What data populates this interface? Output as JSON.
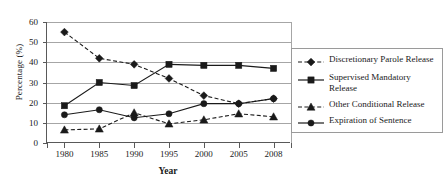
{
  "chart_data": {
    "type": "line",
    "title": "",
    "xlabel": "Year",
    "ylabel": "Percentage (%)",
    "categories": [
      "1980",
      "1985",
      "1990",
      "1995",
      "2000",
      "2005",
      "2008"
    ],
    "ylim": [
      0,
      60
    ],
    "ytick_labels": [
      "0",
      "10",
      "20",
      "30",
      "40",
      "50",
      "60"
    ],
    "ytick_values": [
      0,
      10,
      20,
      30,
      40,
      50,
      60
    ],
    "grid": "horizontal",
    "legend_position": "right",
    "series": [
      {
        "name": "Discretionary Parole Release",
        "marker": "diamond",
        "line_style": "dashed",
        "color": "#1a1a1a",
        "values": [
          55,
          42,
          39,
          32,
          23.5,
          19.5,
          22
        ]
      },
      {
        "name": "Supervised Mandatory Release",
        "legend_label": "Supervised Mandatory\nRelease",
        "marker": "square",
        "line_style": "solid",
        "color": "#1a1a1a",
        "values": [
          18.5,
          30,
          28.5,
          39,
          38.5,
          38.5,
          37
        ]
      },
      {
        "name": "Other Conditional Release",
        "marker": "triangle",
        "line_style": "dashed",
        "color": "#1a1a1a",
        "values": [
          6.5,
          7,
          15,
          9.5,
          11.5,
          14.5,
          13
        ]
      },
      {
        "name": "Expiration of Sentence",
        "marker": "circle",
        "line_style": "solid",
        "color": "#1a1a1a",
        "values": [
          14,
          16.5,
          12.5,
          14.5,
          19.5,
          19.5,
          22
        ]
      }
    ]
  },
  "legend": {
    "entries": [
      "Discretionary Parole Release",
      "Supervised Mandatory\nRelease",
      "Other Conditional Release",
      "Expiration of Sentence"
    ]
  },
  "colors": {
    "line": "#1a1a1a",
    "grid": "#a6a6a6",
    "axis": "#595959",
    "background": "#ffffff"
  }
}
